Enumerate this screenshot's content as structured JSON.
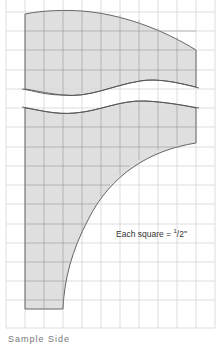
{
  "diagram": {
    "type": "pattern-template",
    "grid": {
      "cell_px": 19.2,
      "columns": 11,
      "rows": 17,
      "line_color": "#d4d4d4",
      "fill_color": "#d9d9d9",
      "outline_color": "#555555"
    },
    "scale_label": {
      "prefix": "Each square = ",
      "numerator": "1",
      "denominator": "2",
      "unit": "\""
    },
    "caption": "Sample Side"
  }
}
